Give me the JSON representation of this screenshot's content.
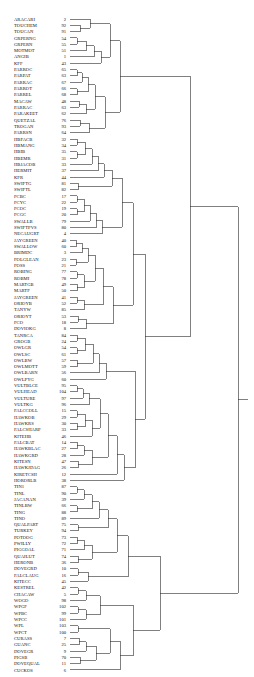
{
  "figure": {
    "kind": "dendrogram",
    "title": "",
    "orientation": "left-to-right",
    "leaf_count": 104,
    "line_color": "#2b2b2b",
    "background_color": "#ffffff",
    "text_color": "#101010"
  },
  "chart_data": {
    "type": "table",
    "title": "",
    "xlabel": "",
    "ylabel": "",
    "leaves": [
      {
        "label": "ARACARI",
        "id": 2
      },
      {
        "label": "TOUCHEM",
        "id": 92
      },
      {
        "label": "TOUCAN",
        "id": 91
      },
      {
        "label": "GRPERNG",
        "id": 54
      },
      {
        "label": "GRPERN",
        "id": 55
      },
      {
        "label": "MOTMOT",
        "id": 51
      },
      {
        "label": "ANGIB",
        "id": 1
      },
      {
        "label": "KFF",
        "id": 43
      },
      {
        "label": "PARROC",
        "id": 65
      },
      {
        "label": "PARPAT",
        "id": 63
      },
      {
        "label": "PARRAC",
        "id": 67
      },
      {
        "label": "PARROT",
        "id": 66
      },
      {
        "label": "PARREL",
        "id": 68
      },
      {
        "label": "MACAW",
        "id": 48
      },
      {
        "label": "PARRAC",
        "id": 63
      },
      {
        "label": "PARAKEET",
        "id": 62
      },
      {
        "label": "QUETZAL",
        "id": 76
      },
      {
        "label": "TROGAN",
        "id": 93
      },
      {
        "label": "PARRSN",
        "id": 64
      },
      {
        "label": "HBFACB",
        "id": 32
      },
      {
        "label": "HBMANG",
        "id": 34
      },
      {
        "label": "HBIB",
        "id": 35
      },
      {
        "label": "HBEMR",
        "id": 31
      },
      {
        "label": "HBJACOB",
        "id": 33
      },
      {
        "label": "HERMIT",
        "id": 37
      },
      {
        "label": "KFR",
        "id": 44
      },
      {
        "label": "SWIFTG",
        "id": 81
      },
      {
        "label": "SWIFTL",
        "id": 82
      },
      {
        "label": "FCBC",
        "id": 17
      },
      {
        "label": "FCYC",
        "id": 22
      },
      {
        "label": "FCOC",
        "id": 19
      },
      {
        "label": "FCGC",
        "id": 20
      },
      {
        "label": "SWALLB",
        "id": 79
      },
      {
        "label": "SWIFTPVS",
        "id": 80
      },
      {
        "label": "NECAUGRT",
        "id": 4
      },
      {
        "label": "JAYGREEN",
        "id": 40
      },
      {
        "label": "SWALLOW",
        "id": 60
      },
      {
        "label": "BRIMDC",
        "id": 3
      },
      {
        "label": "FOLGLEAN",
        "id": 23
      },
      {
        "label": "FOSS",
        "id": 21
      },
      {
        "label": "ROBING",
        "id": 77
      },
      {
        "label": "ROBMI",
        "id": 78
      },
      {
        "label": "MARTGB",
        "id": 49
      },
      {
        "label": "MARTF",
        "id": 50
      },
      {
        "label": "JAYGREEN",
        "id": 41
      },
      {
        "label": "ORIOYB",
        "id": 52
      },
      {
        "label": "TANYW",
        "id": 85
      },
      {
        "label": "ORIOYT",
        "id": 53
      },
      {
        "label": "FCO",
        "id": 18
      },
      {
        "label": "DOVIOKG",
        "id": 8
      },
      {
        "label": "TANRCA",
        "id": 84
      },
      {
        "label": "GROGB",
        "id": 24
      },
      {
        "label": "OWLGR",
        "id": 54
      },
      {
        "label": "OWLSC",
        "id": 61
      },
      {
        "label": "OWLBW",
        "id": 57
      },
      {
        "label": "OWLMOTT",
        "id": 59
      },
      {
        "label": "OWLBARN",
        "id": 56
      },
      {
        "label": "OWLPYG",
        "id": 60
      },
      {
        "label": "VULTBLCE",
        "id": 95
      },
      {
        "label": "VULHEAD",
        "id": 104
      },
      {
        "label": "VULTURE",
        "id": 97
      },
      {
        "label": "VULTKG",
        "id": 96
      },
      {
        "label": "FALCCOLL",
        "id": 15
      },
      {
        "label": "HAWKOB",
        "id": 29
      },
      {
        "label": "HAWKRS",
        "id": 30
      },
      {
        "label": "FALCSHARP",
        "id": 33
      },
      {
        "label": "KITEHB",
        "id": 46
      },
      {
        "label": "FALCBAT",
        "id": 14
      },
      {
        "label": "HAWKBLAC",
        "id": 27
      },
      {
        "label": "HAWKGRD",
        "id": 28
      },
      {
        "label": "KITESN",
        "id": 47
      },
      {
        "label": "HAWKJDAG",
        "id": 26
      },
      {
        "label": "KIRETCSH",
        "id": 12
      },
      {
        "label": "HORORLB",
        "id": 38
      },
      {
        "label": "TIN1",
        "id": 87
      },
      {
        "label": "TINL",
        "id": 90
      },
      {
        "label": "JACANAN",
        "id": 39
      },
      {
        "label": "TINLBW",
        "id": 66
      },
      {
        "label": "TING",
        "id": 88
      },
      {
        "label": "TINO",
        "id": 89
      },
      {
        "label": "QUALPART",
        "id": 75
      },
      {
        "label": "TURKEY",
        "id": 94
      },
      {
        "label": "POTOOG",
        "id": 73
      },
      {
        "label": "PWILLY",
        "id": 72
      },
      {
        "label": "PIGGOAL",
        "id": 71
      },
      {
        "label": "QUAILUT",
        "id": 74
      },
      {
        "label": "HERONB",
        "id": 36
      },
      {
        "label": "DOVEGRD",
        "id": 10
      },
      {
        "label": "FALCLAUG",
        "id": 16
      },
      {
        "label": "KITECC",
        "id": 45
      },
      {
        "label": "KESTREL",
        "id": 42
      },
      {
        "label": "CHACAW",
        "id": 5
      },
      {
        "label": "WOGO",
        "id": 98
      },
      {
        "label": "WPGF",
        "id": 102
      },
      {
        "label": "WPBC",
        "id": 99
      },
      {
        "label": "WPCC",
        "id": 101
      },
      {
        "label": "WPL",
        "id": 103
      },
      {
        "label": "WPCT",
        "id": 100
      },
      {
        "label": "CURASS",
        "id": 7
      },
      {
        "label": "GUANC",
        "id": 25
      },
      {
        "label": "DOVEGR",
        "id": 9
      },
      {
        "label": "PIGSB",
        "id": 70
      },
      {
        "label": "DOVEQUAL",
        "id": 11
      },
      {
        "label": "CUCKOS",
        "id": 6
      }
    ]
  }
}
